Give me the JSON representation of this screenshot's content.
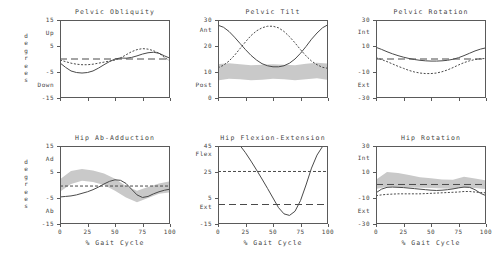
{
  "figure": {
    "y_axis_group_label": "degrees",
    "x_axis_title": "% Gait Cycle",
    "x_ticks": [
      "0",
      "25",
      "50",
      "75",
      "100"
    ],
    "band_color": "#c9c9c9",
    "solid_color": "#4a4a4a",
    "dashed_color": "#4a4a4a",
    "frame_color": "#5a5a5a"
  },
  "chart_data": [
    {
      "id": "pelvic-obliquity",
      "type": "line",
      "title": "Pelvic Obliquity",
      "row": 0,
      "col": 0,
      "xlabel": "",
      "ylabel": "degrees",
      "xlim": [
        0,
        100
      ],
      "ylim": [
        -15,
        15
      ],
      "yticks": [
        -15,
        -5,
        5,
        15
      ],
      "yticklabels": [
        "-15",
        "-5",
        "5",
        "15"
      ],
      "xticks": [
        0,
        25,
        50,
        75,
        100
      ],
      "xticklabels": [
        "",
        "",
        "",
        "",
        ""
      ],
      "pos_label": "Up",
      "neg_label": "Down",
      "pos_label_value": 10,
      "neg_label_value": -10,
      "grid": false,
      "legend": null,
      "band": null,
      "series": [
        {
          "name": "affected-side",
          "style": "solid",
          "x": [
            0,
            5,
            10,
            15,
            20,
            25,
            30,
            35,
            40,
            45,
            50,
            55,
            60,
            65,
            70,
            75,
            80,
            85,
            90,
            95,
            100
          ],
          "values": [
            -1.5,
            -3.2,
            -4.6,
            -5.2,
            -5.4,
            -5.2,
            -4.6,
            -3.5,
            -2.2,
            -1.0,
            0.0,
            0.4,
            0.3,
            0.6,
            1.2,
            1.9,
            2.4,
            2.6,
            2.2,
            1.2,
            0.3
          ]
        },
        {
          "name": "contralateral-side",
          "style": "dotted",
          "x": [
            0,
            5,
            10,
            15,
            20,
            25,
            30,
            35,
            40,
            45,
            50,
            55,
            60,
            65,
            70,
            75,
            80,
            85,
            90,
            95,
            100
          ],
          "values": [
            -0.4,
            -1.0,
            -1.6,
            -2.0,
            -2.2,
            -2.2,
            -2.0,
            -1.6,
            -1.2,
            -0.8,
            -0.4,
            0.4,
            1.6,
            2.8,
            3.6,
            4.0,
            3.8,
            3.2,
            2.2,
            0.6,
            -0.8
          ]
        },
        {
          "name": "reference-mean",
          "style": "longdash",
          "x": [
            0,
            100
          ],
          "values": [
            0.0,
            0.0
          ]
        }
      ]
    },
    {
      "id": "pelvic-tilt",
      "type": "line",
      "title": "Pelvic Tilt",
      "row": 0,
      "col": 1,
      "xlabel": "",
      "ylabel": "",
      "xlim": [
        0,
        100
      ],
      "ylim": [
        0,
        30
      ],
      "yticks": [
        0,
        10,
        20,
        30
      ],
      "yticklabels": [
        "0",
        "10",
        "20",
        "30"
      ],
      "xticks": [
        0,
        25,
        50,
        75,
        100
      ],
      "xticklabels": [
        "",
        "",
        "",
        "",
        ""
      ],
      "pos_label": "Ant",
      "neg_label": "Post",
      "pos_label_value": 26,
      "neg_label_value": 5,
      "grid": false,
      "legend": null,
      "band": {
        "x": [
          0,
          10,
          20,
          30,
          40,
          50,
          60,
          70,
          80,
          90,
          100
        ],
        "upper": [
          13.0,
          13.4,
          13.0,
          12.6,
          12.8,
          13.0,
          12.8,
          12.6,
          13.2,
          13.6,
          13.2
        ],
        "lower": [
          6.8,
          7.4,
          7.2,
          6.8,
          7.0,
          7.4,
          7.2,
          6.8,
          7.2,
          7.6,
          7.0
        ]
      },
      "series": [
        {
          "name": "affected-side",
          "style": "solid",
          "x": [
            0,
            5,
            10,
            15,
            20,
            25,
            30,
            35,
            40,
            45,
            50,
            55,
            60,
            65,
            70,
            75,
            80,
            85,
            90,
            95,
            100
          ],
          "values": [
            28.0,
            27.2,
            25.6,
            23.4,
            21.0,
            18.6,
            16.4,
            14.6,
            13.2,
            12.4,
            12.0,
            12.0,
            12.4,
            13.4,
            15.0,
            17.2,
            19.8,
            22.6,
            25.0,
            27.0,
            28.2
          ]
        },
        {
          "name": "contralateral-side",
          "style": "dotted",
          "x": [
            0,
            5,
            10,
            15,
            20,
            25,
            30,
            35,
            40,
            45,
            50,
            55,
            60,
            65,
            70,
            75,
            80,
            85,
            90,
            95,
            100
          ],
          "values": [
            11.6,
            12.6,
            14.2,
            16.4,
            19.0,
            21.6,
            24.0,
            25.8,
            27.0,
            27.6,
            27.6,
            27.0,
            25.6,
            23.6,
            21.2,
            18.6,
            16.2,
            14.2,
            12.8,
            11.8,
            11.4
          ]
        }
      ]
    },
    {
      "id": "pelvic-rotation",
      "type": "line",
      "title": "Pelvic Rotation",
      "row": 0,
      "col": 2,
      "xlabel": "",
      "ylabel": "",
      "xlim": [
        0,
        100
      ],
      "ylim": [
        -30,
        30
      ],
      "yticks": [
        -30,
        -10,
        10,
        30
      ],
      "yticklabels": [
        "-30",
        "-10",
        "10",
        "30"
      ],
      "xticks": [
        0,
        25,
        50,
        75,
        100
      ],
      "xticklabels": [
        "",
        "",
        "",
        "",
        ""
      ],
      "pos_label": "Int",
      "neg_label": "Ext",
      "pos_label_value": 21,
      "neg_label_value": -20,
      "grid": false,
      "legend": null,
      "band": null,
      "series": [
        {
          "name": "affected-side",
          "style": "solid",
          "x": [
            0,
            5,
            10,
            15,
            20,
            25,
            30,
            35,
            40,
            45,
            50,
            55,
            60,
            65,
            70,
            75,
            80,
            85,
            90,
            95,
            100
          ],
          "values": [
            9.0,
            7.4,
            5.6,
            4.0,
            2.6,
            1.4,
            0.4,
            -0.4,
            -1.0,
            -1.4,
            -1.6,
            -1.6,
            -1.4,
            -1.0,
            -0.2,
            1.0,
            2.6,
            4.4,
            6.2,
            7.6,
            8.6
          ]
        },
        {
          "name": "contralateral-side",
          "style": "dotted",
          "x": [
            0,
            5,
            10,
            15,
            20,
            25,
            30,
            35,
            40,
            45,
            50,
            55,
            60,
            65,
            70,
            75,
            80,
            85,
            90,
            95,
            100
          ],
          "values": [
            1.0,
            -0.4,
            -2.0,
            -3.8,
            -5.6,
            -7.2,
            -8.8,
            -10.0,
            -10.8,
            -11.2,
            -11.2,
            -10.8,
            -9.8,
            -8.4,
            -6.6,
            -4.6,
            -2.8,
            -1.4,
            -0.4,
            0.2,
            0.4
          ]
        },
        {
          "name": "reference-mean",
          "style": "longdash",
          "x": [
            0,
            100
          ],
          "values": [
            0.0,
            0.0
          ]
        }
      ]
    },
    {
      "id": "hip-ab-adduction",
      "type": "line",
      "title": "Hip Ab-Adduction",
      "row": 1,
      "col": 0,
      "xlabel": "% Gait Cycle",
      "ylabel": "degrees",
      "xlim": [
        0,
        100
      ],
      "ylim": [
        -15,
        15
      ],
      "yticks": [
        -15,
        -5,
        5,
        15
      ],
      "yticklabels": [
        "-15",
        "-5",
        "5",
        "15"
      ],
      "xticks": [
        0,
        25,
        50,
        75,
        100
      ],
      "xticklabels": [
        "0",
        "25",
        "50",
        "75",
        "100"
      ],
      "pos_label": "Ad",
      "neg_label": "Ab",
      "pos_label_value": 10,
      "neg_label_value": -10,
      "grid": false,
      "legend": null,
      "band": {
        "x": [
          0,
          10,
          20,
          30,
          40,
          50,
          60,
          70,
          80,
          90,
          100
        ],
        "upper": [
          2.2,
          5.4,
          6.2,
          5.6,
          4.4,
          2.4,
          -0.4,
          -2.2,
          -0.8,
          0.6,
          1.4
        ],
        "lower": [
          -2.6,
          0.4,
          1.6,
          1.2,
          0.0,
          -2.2,
          -4.8,
          -6.6,
          -5.0,
          -3.4,
          -2.8
        ]
      },
      "series": [
        {
          "name": "affected-side",
          "style": "solid",
          "x": [
            0,
            5,
            10,
            15,
            20,
            25,
            30,
            35,
            40,
            45,
            50,
            55,
            60,
            65,
            70,
            75,
            80,
            85,
            90,
            95,
            100
          ],
          "values": [
            -4.6,
            -4.4,
            -4.2,
            -3.8,
            -3.2,
            -2.6,
            -1.8,
            -0.8,
            0.4,
            1.4,
            2.0,
            1.8,
            0.6,
            -1.6,
            -3.8,
            -4.8,
            -4.4,
            -3.4,
            -2.6,
            -2.0,
            -1.6
          ]
        },
        {
          "name": "reference-mean",
          "style": "shortdash",
          "x": [
            0,
            100
          ],
          "values": [
            -0.4,
            -0.4
          ]
        }
      ]
    },
    {
      "id": "hip-flexion-extension",
      "type": "line",
      "title": "Hip Flexion-Extension",
      "row": 1,
      "col": 1,
      "xlabel": "% Gait Cycle",
      "ylabel": "",
      "xlim": [
        0,
        100
      ],
      "ylim": [
        -15,
        45
      ],
      "yticks": [
        -15,
        5,
        25,
        45
      ],
      "yticklabels": [
        "-15",
        "5",
        "25",
        "45"
      ],
      "xticks": [
        0,
        25,
        50,
        75,
        100
      ],
      "xticklabels": [
        "0",
        "25",
        "50",
        "75",
        "100"
      ],
      "pos_label": "Flex",
      "neg_label": "Ext",
      "pos_label_value": 39,
      "neg_label_value": -2,
      "grid": false,
      "legend": null,
      "band": null,
      "series": [
        {
          "name": "affected-side",
          "style": "solid",
          "x": [
            0,
            5,
            10,
            15,
            20,
            25,
            30,
            35,
            40,
            45,
            50,
            55,
            60,
            65,
            70,
            75,
            80,
            85,
            90,
            95,
            100
          ],
          "values": [
            48.0,
            51.0,
            51.6,
            49.6,
            45.4,
            39.8,
            33.4,
            26.6,
            19.6,
            12.4,
            5.0,
            -2.4,
            -7.2,
            -8.4,
            -5.2,
            3.0,
            15.0,
            28.0,
            38.0,
            44.6,
            47.4
          ]
        },
        {
          "name": "reference-mean-flex",
          "style": "shortdash",
          "x": [
            0,
            100
          ],
          "values": [
            25.4,
            25.4
          ]
        },
        {
          "name": "reference-mean-ext",
          "style": "longdash",
          "x": [
            0,
            100
          ],
          "values": [
            0.0,
            0.0
          ]
        }
      ]
    },
    {
      "id": "hip-rotation",
      "type": "line",
      "title": "Hip Rotation",
      "row": 1,
      "col": 2,
      "xlabel": "% Gait Cycle",
      "ylabel": "",
      "xlim": [
        0,
        100
      ],
      "ylim": [
        -30,
        30
      ],
      "yticks": [
        -30,
        -10,
        10,
        30
      ],
      "yticklabels": [
        "-30",
        "-10",
        "10",
        "30"
      ],
      "xticks": [
        0,
        25,
        50,
        75,
        100
      ],
      "xticklabels": [
        "0",
        "25",
        "50",
        "75",
        "100"
      ],
      "pos_label": "Int",
      "neg_label": "Ext",
      "pos_label_value": 21,
      "neg_label_value": -20,
      "grid": false,
      "legend": null,
      "band": {
        "x": [
          0,
          10,
          20,
          30,
          40,
          50,
          60,
          70,
          80,
          90,
          100
        ],
        "upper": [
          4.0,
          10.0,
          9.2,
          7.6,
          6.0,
          5.2,
          4.2,
          4.0,
          6.4,
          5.0,
          3.6
        ],
        "lower": [
          -3.0,
          -1.4,
          -1.6,
          -2.0,
          -2.2,
          -2.4,
          -2.6,
          -2.8,
          -2.0,
          -2.4,
          -3.2
        ]
      },
      "series": [
        {
          "name": "affected-side",
          "style": "solid",
          "x": [
            0,
            5,
            10,
            15,
            20,
            25,
            30,
            35,
            40,
            45,
            50,
            55,
            60,
            65,
            70,
            75,
            80,
            85,
            90,
            95,
            100
          ],
          "values": [
            -6.0,
            -3.2,
            -1.8,
            -1.6,
            -1.8,
            -2.0,
            -2.4,
            -2.8,
            -3.2,
            -3.6,
            -4.0,
            -4.2,
            -4.0,
            -3.6,
            -3.0,
            -2.2,
            -1.6,
            -1.8,
            -3.6,
            -6.4,
            -8.2
          ]
        },
        {
          "name": "contralateral-side",
          "style": "dotted",
          "x": [
            0,
            5,
            10,
            15,
            20,
            25,
            30,
            35,
            40,
            45,
            50,
            55,
            60,
            65,
            70,
            75,
            80,
            85,
            90,
            95,
            100
          ],
          "values": [
            -8.2,
            -7.6,
            -7.2,
            -7.0,
            -6.8,
            -6.8,
            -6.8,
            -6.8,
            -6.8,
            -6.6,
            -6.4,
            -6.2,
            -6.0,
            -5.8,
            -5.6,
            -5.4,
            -5.0,
            -5.0,
            -5.4,
            -5.8,
            -6.0
          ]
        },
        {
          "name": "reference-mean",
          "style": "longdash",
          "x": [
            0,
            100
          ],
          "values": [
            0.4,
            0.4
          ]
        }
      ]
    }
  ]
}
